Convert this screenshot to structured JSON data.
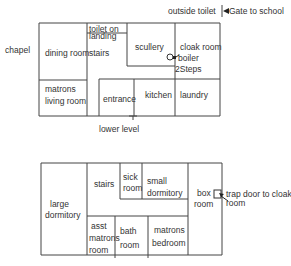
{
  "upper_plan": {
    "outside_labels": {
      "chapel": "chapel",
      "outside_toilet": "outside toilet",
      "gate": "Gate to school",
      "level": "lower level"
    },
    "rooms": {
      "toilet_line1": "toilet on",
      "toilet_line2": "landing",
      "dining_room": "dining room",
      "stairs": "stairs",
      "scullery": "scullery",
      "cloak_room": "cloak  room",
      "boiler": "boiler",
      "steps": "2Steps",
      "matrons_living_line1": "matrons",
      "matrons_living_line2": "living room",
      "entrance": "entrance",
      "kitchen": "kitchen",
      "laundry": "laundry"
    }
  },
  "lower_plan": {
    "rooms": {
      "large_dorm_line1": "large",
      "large_dorm_line2": "dormitory",
      "stairs": "stairs",
      "sick_line1": "sick",
      "sick_line2": "room",
      "small_dorm_line1": "small",
      "small_dorm_line2": "dormitory",
      "box_line1": "box",
      "box_line2": "room",
      "asst_line1": "asst",
      "asst_line2": "matrons",
      "asst_line3": "room",
      "bath_line1": "bath",
      "bath_line2": "room",
      "matrons_bed_line1": "matrons",
      "matrons_bed_line2": "bedroom"
    },
    "annotations": {
      "trap_line1": "trap door to cloak",
      "trap_line2": "room"
    }
  }
}
